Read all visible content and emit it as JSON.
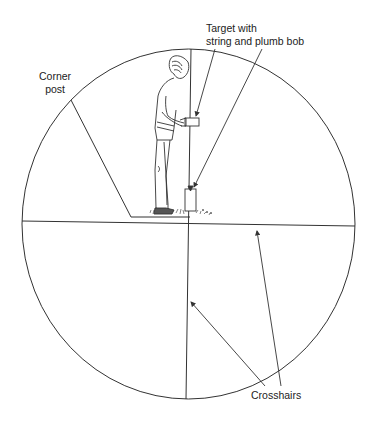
{
  "diagram": {
    "labels": {
      "target": [
        "Target with",
        "string and plumb bob"
      ],
      "corner_post": [
        "Corner",
        "post"
      ],
      "crosshairs": "Crosshairs"
    },
    "elements": {
      "field_of_view": "circle",
      "crosshair_horizontal": "line",
      "crosshair_vertical": "line",
      "figure": "person holding target beside corner post"
    },
    "colors": {
      "line": "#333333",
      "background": "#ffffff"
    }
  }
}
